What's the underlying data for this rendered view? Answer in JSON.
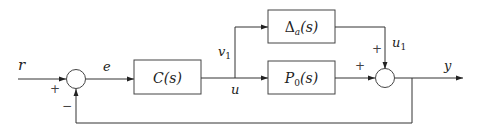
{
  "diagram": {
    "type": "block-diagram",
    "signals": {
      "reference": "r",
      "error": "e",
      "control": "u",
      "v1": "v",
      "v1_sub": "1",
      "u1": "u",
      "u1_sub": "1",
      "output": "y"
    },
    "blocks": {
      "controller": "C(s)",
      "uncertainty_main": "Δ",
      "uncertainty_sub": "a",
      "uncertainty_arg": "(s)",
      "plant_main": "P",
      "plant_sub": "0",
      "plant_arg": "(s)"
    },
    "signs": {
      "sum1_r": "+",
      "sum1_fb": "−",
      "sum2_p": "+",
      "sum2_delta": "+"
    }
  }
}
